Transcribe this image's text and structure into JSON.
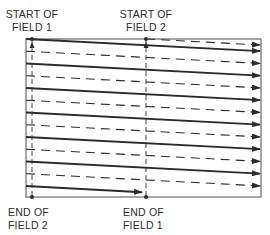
{
  "diagram": {
    "labels": {
      "start_field_1": [
        "START OF",
        "FIELD 1"
      ],
      "start_field_2": [
        "START OF",
        "FIELD 2"
      ],
      "end_field_2": [
        "END OF",
        "FIELD 2"
      ],
      "end_field_1": [
        "END OF",
        "FIELD 1"
      ]
    },
    "fields": [
      {
        "name": "Field 1",
        "line_style": "solid",
        "scan_lines": 7,
        "last_line": "half"
      },
      {
        "name": "Field 2",
        "line_style": "dashed",
        "scan_lines": 7,
        "first_line": "half"
      }
    ],
    "colors": {
      "line": "#2b2b2b",
      "frame": "#6a6a6a",
      "background": "#ffffff"
    }
  }
}
